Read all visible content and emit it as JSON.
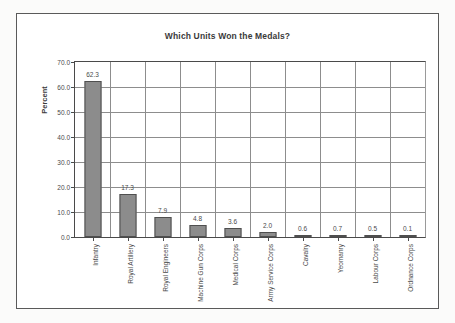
{
  "figure": {
    "title": "Which Units Won the Medals?",
    "background_color": "#ffffff",
    "frame_color": "#5a5a5a",
    "bar_color": "#8c8c8c",
    "bar_edge_color": "#4f4f4f",
    "grid_color": "#8d8d8d"
  },
  "chart_data": {
    "type": "bar",
    "title": "Which Units Won the Medals?",
    "xlabel": "",
    "ylabel": "Percent",
    "ylim": [
      0.0,
      70.0
    ],
    "yticks": [
      "0.0",
      "10.0",
      "20.0",
      "30.0",
      "40.0",
      "50.0",
      "60.0",
      "70.0"
    ],
    "ytick_values": [
      0.0,
      10.0,
      20.0,
      30.0,
      40.0,
      50.0,
      60.0,
      70.0
    ],
    "grid": true,
    "legend": false,
    "categories": [
      "Infantry",
      "Royal Artillery",
      "Royal Engineers",
      "Machine Gun Corps",
      "Medical Corps",
      "Army Service Corps",
      "Cavalry",
      "Yeomanry",
      "Labour Corps",
      "Ordnance Corps"
    ],
    "values": [
      62.3,
      17.3,
      7.9,
      4.8,
      3.6,
      2.0,
      0.6,
      0.7,
      0.5,
      0.1
    ],
    "data_labels": [
      "62.3",
      "17.3",
      "7.9",
      "4.8",
      "3.6",
      "2.0",
      "0.6",
      "0.7",
      "0.5",
      "0.1"
    ]
  }
}
